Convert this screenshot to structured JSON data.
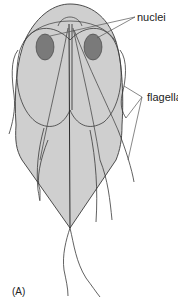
{
  "figure": {
    "panel_label": "(A)",
    "labels": {
      "nuclei": "nuclei",
      "flagella": "flagella"
    },
    "colors": {
      "body_fill": "#cfcfcf",
      "nucleus_fill": "#7a7a7a",
      "outline": "#3a3a3a",
      "leader_line": "#555555"
    }
  }
}
